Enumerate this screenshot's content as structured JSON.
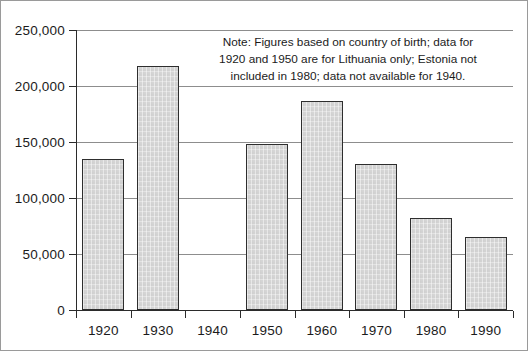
{
  "chart_data": {
    "type": "bar",
    "title": "",
    "xlabel": "",
    "ylabel": "",
    "categories": [
      "1920",
      "1930",
      "1940",
      "1950",
      "1960",
      "1970",
      "1980",
      "1990"
    ],
    "values": [
      135000,
      218000,
      null,
      148000,
      187000,
      130000,
      82000,
      65000
    ],
    "ylim": [
      0,
      250000
    ],
    "yticks": [
      0,
      50000,
      100000,
      150000,
      200000,
      250000
    ],
    "ytick_labels": [
      "0",
      "50,000",
      "100,000",
      "150,000",
      "200,000",
      "250,000"
    ],
    "grid": true,
    "legend": null,
    "bar_fill_color": "#d6d6d6",
    "bar_border_color": "#2e2e2e",
    "gridline_color": "#8d8d8d",
    "axis_color": "#2b2b2b",
    "text_color": "#1b1b1b",
    "annotations": [
      {
        "name": "note",
        "lines": [
          "Note: Figures based on country of birth; data for",
          "1920 and 1950 are for Lithuania only;  Estonia not",
          "included in 1980; data not available for 1940."
        ]
      }
    ]
  }
}
